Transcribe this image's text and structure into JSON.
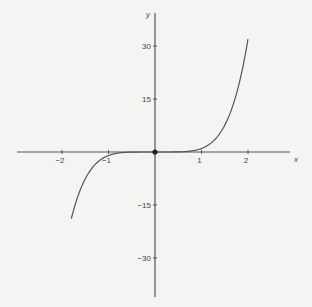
{
  "chart_data": {
    "type": "line",
    "title": "",
    "xlabel": "x",
    "ylabel": "y",
    "function": "y = x^5",
    "xlim": [
      -2.95,
      2.9
    ],
    "ylim": [
      -43,
      38
    ],
    "x_ticks": [
      -2,
      -1,
      1,
      2
    ],
    "x_tick_labels": [
      "−2",
      "−1",
      "1",
      "2"
    ],
    "y_ticks": [
      30,
      15,
      -15,
      -30
    ],
    "y_tick_labels": [
      "30",
      "15",
      "−15",
      "−30"
    ],
    "grid": false,
    "legend": null,
    "series": [
      {
        "name": "x^5",
        "color": "#555555",
        "x": [
          -1.8,
          -1.6,
          -1.4,
          -1.2,
          -1.0,
          -0.8,
          -0.6,
          -0.4,
          -0.2,
          0.0,
          0.2,
          0.4,
          0.6,
          0.8,
          1.0,
          1.2,
          1.4,
          1.6,
          1.8,
          2.0
        ],
        "y": [
          -18.9,
          -10.5,
          -5.38,
          -2.49,
          -1.0,
          -0.33,
          -0.08,
          -0.01,
          0.0,
          0.0,
          0.0,
          0.01,
          0.08,
          0.33,
          1.0,
          2.49,
          5.38,
          10.49,
          18.9,
          32.0
        ]
      }
    ],
    "annotations": [
      {
        "type": "point",
        "x": 0,
        "y": 0,
        "label": "origin"
      }
    ]
  },
  "layout": {
    "origin_px": [
      155,
      152
    ],
    "px_per_x_unit": 46.5,
    "px_per_y_unit": 3.53,
    "x_axis_px": [
      17,
      290
    ],
    "y_axis_px": [
      13,
      297
    ]
  }
}
